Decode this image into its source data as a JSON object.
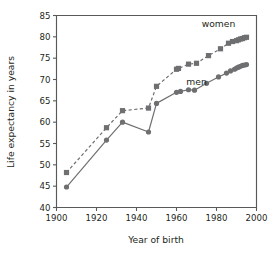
{
  "chart_data": {
    "type": "line",
    "title": "",
    "subtitle": "",
    "xlabel": "Year of birth",
    "ylabel": "Life expectancy in years",
    "xlim": [
      1900,
      2000
    ],
    "ylim": [
      40,
      85
    ],
    "xticks": [
      1900,
      1920,
      1940,
      1960,
      1980,
      2000
    ],
    "yticks": [
      40,
      45,
      50,
      55,
      60,
      65,
      70,
      75,
      80,
      85
    ],
    "xtick_labels": [
      "1900",
      "1920",
      "1940",
      "1960",
      "1980",
      "2000"
    ],
    "ytick_labels": [
      "40",
      "45",
      "50",
      "55",
      "60",
      "65",
      "70",
      "75",
      "80",
      "85"
    ],
    "grid": false,
    "legend": "inline-annotations",
    "series": [
      {
        "name": "women",
        "label": "women",
        "marker": "square",
        "linestyle": "dashed",
        "color": "#6e6f71",
        "label_position": {
          "x": 1981,
          "y": 82.2
        },
        "x": [
          1905,
          1925,
          1933,
          1946,
          1950,
          1960,
          1961,
          1966,
          1970,
          1976,
          1982,
          1986,
          1988,
          1990,
          1991,
          1992,
          1993,
          1994,
          1995
        ],
        "y": [
          48.2,
          58.7,
          62.7,
          63.3,
          68.4,
          72.4,
          72.6,
          73.6,
          73.8,
          75.6,
          77.2,
          78.5,
          78.9,
          79.1,
          79.3,
          79.5,
          79.6,
          79.8,
          79.9
        ]
      },
      {
        "name": "men",
        "label": "men",
        "marker": "circle",
        "linestyle": "solid",
        "color": "#6e6f71",
        "label_position": {
          "x": 1970,
          "y": 68.6
        },
        "x": [
          1905,
          1925,
          1933,
          1946,
          1950,
          1960,
          1962,
          1966,
          1969,
          1975,
          1981,
          1985,
          1987,
          1989,
          1990,
          1991,
          1992,
          1993,
          1994,
          1995
        ],
        "y": [
          44.8,
          55.8,
          60.0,
          57.7,
          64.4,
          67.0,
          67.2,
          67.6,
          67.5,
          69.1,
          70.6,
          71.5,
          72.0,
          72.4,
          72.7,
          72.9,
          73.1,
          73.3,
          73.4,
          73.5
        ]
      }
    ]
  },
  "figure": {
    "axis_color": "#58595b",
    "text_color": "#231f20",
    "background": "#ffffff"
  }
}
